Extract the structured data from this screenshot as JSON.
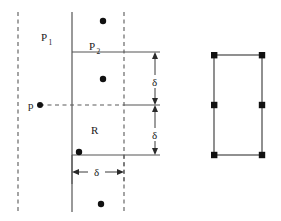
{
  "figure": {
    "width": 281,
    "height": 221,
    "background": "#ffffff",
    "stroke_color": "#4a4a4a",
    "dash_color": "#5a5a5a",
    "dot_color": "#111111",
    "text_color": "#1a1a1a"
  },
  "labels": {
    "p1": {
      "base": "P",
      "sub": "1",
      "x": 45,
      "y": 41
    },
    "p2": {
      "base": "P",
      "sub": "2",
      "x": 93,
      "y": 50
    },
    "point_p": {
      "text": "p",
      "x": 30,
      "y": 109
    },
    "region_r": {
      "text": "R",
      "x": 94,
      "y": 134
    },
    "delta_top": {
      "text": "δ",
      "x": 157,
      "y": 82
    },
    "delta_bottom": {
      "text": "δ",
      "x": 157,
      "y": 135
    },
    "delta_width": {
      "text": "δ",
      "x": 96,
      "y": 176
    }
  },
  "geometry": {
    "dashed_vertical_left": {
      "x": 18,
      "y1": 12,
      "y2": 212
    },
    "dashed_vertical_right": {
      "x": 124,
      "y1": 12,
      "y2": 212
    },
    "solid_vertical_left": {
      "x": 72,
      "y1": 12,
      "y2": 212
    },
    "dashed_horizontal_p": {
      "x1": 30,
      "x2": 160,
      "y": 105
    },
    "rect_r": {
      "x": 72,
      "y": 52,
      "width": 52,
      "height": 103
    },
    "rect_r_mid_line": {
      "x1": 72,
      "x2": 160,
      "y": 105
    },
    "rect_r_top_extension": {
      "x1": 124,
      "x2": 160,
      "y": 52
    },
    "rect_r_bottom_extension": {
      "x1": 124,
      "x2": 160,
      "y": 155
    },
    "dim_vertical_x": 155,
    "dim_vertical_top": {
      "y1": 53,
      "y2": 104
    },
    "dim_vertical_bottom": {
      "y1": 106,
      "y2": 154
    },
    "dim_horizontal": {
      "y": 172,
      "x1": 72,
      "x2": 124
    },
    "dim_horizontal_tick_left": {
      "x": 72,
      "y1": 157,
      "y2": 182
    },
    "dim_horizontal_tick_right": {
      "x": 124,
      "y1": 157,
      "y2": 182
    },
    "rect_right": {
      "x": 214,
      "y": 55,
      "width": 48,
      "height": 100
    }
  },
  "points": {
    "label": "sample points",
    "left_figure": [
      {
        "name": "point-above-slab",
        "x": 103,
        "y": 21
      },
      {
        "name": "point-upper-inside-r",
        "x": 103,
        "y": 79
      },
      {
        "name": "point-p-on-boundary",
        "x": 40,
        "y": 105
      },
      {
        "name": "point-lower-left-in-r",
        "x": 79,
        "y": 152
      },
      {
        "name": "point-below-slab",
        "x": 101,
        "y": 204
      }
    ],
    "right_figure": [
      {
        "name": "corner-top-left",
        "x": 214,
        "y": 55
      },
      {
        "name": "corner-top-right",
        "x": 262,
        "y": 55
      },
      {
        "name": "mid-left",
        "x": 214,
        "y": 105
      },
      {
        "name": "mid-right",
        "x": 262,
        "y": 105
      },
      {
        "name": "corner-bottom-left",
        "x": 214,
        "y": 155
      },
      {
        "name": "corner-bottom-right",
        "x": 262,
        "y": 155
      }
    ]
  }
}
